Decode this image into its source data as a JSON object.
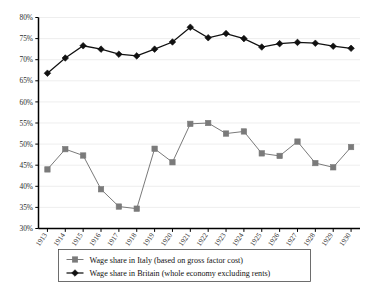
{
  "chart_data": {
    "type": "line",
    "title": "",
    "subtitle": "",
    "xlabel": "",
    "ylabel": "",
    "grid": true,
    "legend_position": "bottom",
    "categories": [
      "1913",
      "1914",
      "1915",
      "1916",
      "1917",
      "1918",
      "1919",
      "1920",
      "1921",
      "1922",
      "1923",
      "1924",
      "1925",
      "1926",
      "1927",
      "1928",
      "1929",
      "1930"
    ],
    "ylim": [
      30,
      80
    ],
    "ytick_labels": [
      "30%",
      "35%",
      "40%",
      "45%",
      "50%",
      "55%",
      "60%",
      "65%",
      "70%",
      "75%",
      "80%"
    ],
    "ytick_values": [
      30,
      35,
      40,
      45,
      50,
      55,
      60,
      65,
      70,
      75,
      80
    ],
    "series": [
      {
        "name": "Wage share in Italy (based on gross factor cost)",
        "marker": "square",
        "color": "#7a7a7a",
        "values": [
          44.0,
          48.8,
          47.3,
          39.3,
          35.2,
          34.7,
          48.9,
          45.7,
          54.8,
          55.0,
          52.5,
          53.0,
          47.8,
          47.2,
          50.6,
          45.5,
          44.5,
          49.3
        ]
      },
      {
        "name": "Wage share in Britain (whole economy excluding rents)",
        "marker": "diamond",
        "color": "#111111",
        "values": [
          66.8,
          70.4,
          73.3,
          72.5,
          71.3,
          70.9,
          72.5,
          74.2,
          77.7,
          75.2,
          76.2,
          75.0,
          73.0,
          73.8,
          74.1,
          73.9,
          73.2,
          72.7
        ]
      }
    ]
  },
  "legend": {
    "entries": [
      {
        "label": "Wage share in Italy (based on gross factor cost)",
        "marker": "square-marker",
        "color": "#7a7a7a"
      },
      {
        "label": "Wage share in Britain (whole economy excluding rents)",
        "marker": "diamond-marker",
        "color": "#111111"
      }
    ]
  }
}
